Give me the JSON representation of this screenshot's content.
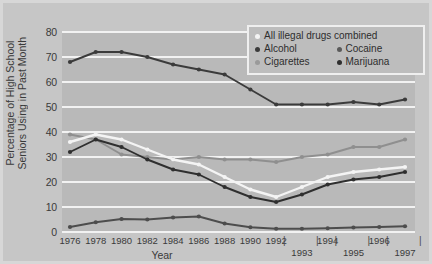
{
  "chart_data": {
    "type": "line",
    "title": "",
    "xlabel": "Year",
    "ylabel": "Percentage of High School\nSeniors Using in Past Month",
    "ylim": [
      0,
      80
    ],
    "yticks": [
      0,
      10,
      20,
      30,
      40,
      50,
      60,
      70,
      80
    ],
    "grid": true,
    "legend_position": "top-right",
    "x": [
      1976,
      1978,
      1980,
      1982,
      1984,
      1986,
      1988,
      1990,
      1992,
      1993,
      1994,
      1995,
      1996,
      1997
    ],
    "xtick_labels": [
      "1976",
      "1978",
      "1980",
      "1982",
      "1984",
      "1986",
      "1988",
      "1990",
      "1992",
      "1993",
      "1994",
      "1995",
      "1996",
      "1997"
    ],
    "xtick_rows": [
      "top",
      "top",
      "top",
      "top",
      "top",
      "top",
      "top",
      "top",
      "top",
      "low",
      "top",
      "low",
      "top",
      "low"
    ],
    "series": [
      {
        "name": "Alcohol",
        "color": "#3b3b3b",
        "marker": "dark-dot",
        "values": [
          68,
          72,
          72,
          70,
          67,
          65,
          63,
          57,
          51,
          51,
          51,
          52,
          51,
          53
        ]
      },
      {
        "name": "Cigarettes",
        "color": "#8f8f8f",
        "marker": "gray-dot",
        "values": [
          39,
          37,
          31,
          30,
          29,
          30,
          29,
          29,
          28,
          30,
          31,
          34,
          34,
          37
        ]
      },
      {
        "name": "All illegal drugs combined",
        "color": "#f4f4f4",
        "marker": "white-dot",
        "values": [
          36,
          39,
          37,
          33,
          29,
          27,
          22,
          17,
          14,
          18,
          22,
          24,
          25,
          26
        ]
      },
      {
        "name": "Marijuana",
        "color": "#2f2f2f",
        "marker": "dark-dot",
        "values": [
          32,
          37,
          34,
          29,
          25,
          23,
          18,
          14,
          12,
          15,
          19,
          21,
          22,
          24
        ]
      },
      {
        "name": "Cocaine",
        "color": "#4d4d4d",
        "marker": "dark-dot",
        "values": [
          2.0,
          3.9,
          5.2,
          5.0,
          5.8,
          6.2,
          3.4,
          1.9,
          1.3,
          1.3,
          1.5,
          1.8,
          2.0,
          2.3
        ]
      }
    ]
  },
  "legend": {
    "rows": [
      [
        {
          "label": "All illegal drugs combined",
          "color": "#f4f4f4",
          "icon": "white-dot-icon",
          "width": "full"
        }
      ],
      [
        {
          "label": "Alcohol",
          "color": "#3b3b3b",
          "icon": "dark-dot-icon",
          "width": "half"
        },
        {
          "label": "Cocaine",
          "color": "#5a5a5a",
          "icon": "dark-dot-icon",
          "width": "half"
        }
      ],
      [
        {
          "label": "Cigarettes",
          "color": "#9a9a9a",
          "icon": "gray-dot-icon",
          "width": "half"
        },
        {
          "label": "Marijuana",
          "color": "#2f2f2f",
          "icon": "dark-dot-icon",
          "width": "half"
        }
      ]
    ]
  }
}
